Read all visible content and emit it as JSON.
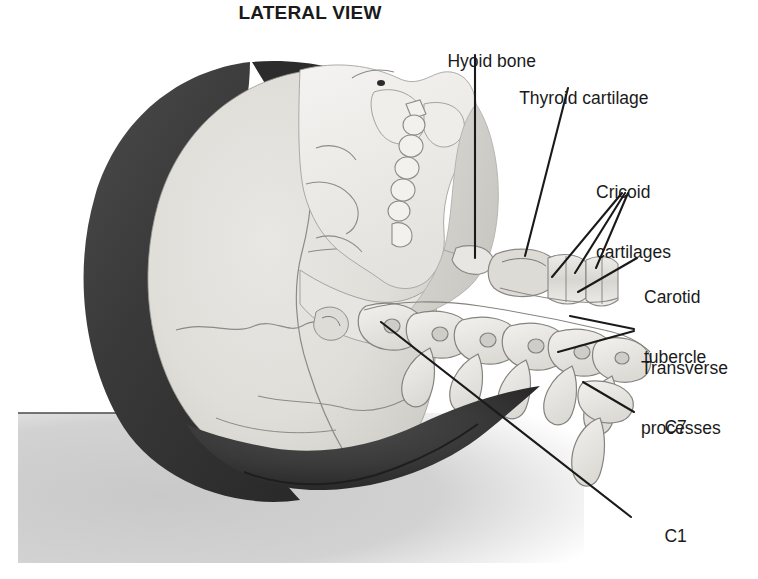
{
  "figure": {
    "title": "LATERAL VIEW",
    "background_color": "#ffffff",
    "ink_color": "#1a1a1a",
    "bone_fill": "#eceae6",
    "soft_tissue_fill": "#d9d7d2",
    "hair_fill": "#3a3a3a",
    "table_surface_fill": "#cfcfcf"
  },
  "labels": [
    {
      "id": "hyoid-bone",
      "text": "Hyoid bone",
      "text2": "",
      "x": 428,
      "y": 31,
      "leader": "vertical"
    },
    {
      "id": "thyroid-cartilage",
      "text": "Thyroid cartilage",
      "text2": "",
      "x": 500,
      "y": 68,
      "leader": "diagonal"
    },
    {
      "id": "cricoid-cartilages",
      "text": "Cricoid",
      "text2": "cartilages",
      "x": 596,
      "y": 141,
      "leader": "three-lines"
    },
    {
      "id": "carotid-tubercle",
      "text": "Carotid",
      "text2": "tubercle",
      "x": 644,
      "y": 246,
      "leader": "diagonal"
    },
    {
      "id": "transverse-processes",
      "text": "Transverse",
      "text2": "processes",
      "x": 641,
      "y": 317,
      "leader": "two-lines"
    },
    {
      "id": "c7",
      "text": "C7",
      "text2": "",
      "x": 645,
      "y": 397,
      "leader": "diagonal"
    },
    {
      "id": "c1",
      "text": "C1",
      "text2": "",
      "x": 645,
      "y": 506,
      "leader": "long-diagonal"
    }
  ],
  "vertebrae": {
    "count": 7,
    "top_label": "C1",
    "bottom_label": "C7"
  },
  "leader_lines": [
    {
      "name": "hyoid-leader",
      "points": "475,55 475,258"
    },
    {
      "name": "thyroid-leader",
      "points": "568,88 525,255"
    },
    {
      "name": "cricoid-leader-1",
      "points": "622,193 553,275"
    },
    {
      "name": "cricoid-leader-2",
      "points": "625,193 575,272"
    },
    {
      "name": "cricoid-leader-3",
      "points": "628,193 594,268"
    },
    {
      "name": "carotid-leader",
      "points": "636,258 578,292"
    },
    {
      "name": "transverse-leader-1",
      "points": "634,329 572,316"
    },
    {
      "name": "transverse-leader-2",
      "points": "634,331 560,350"
    },
    {
      "name": "c7-leader",
      "points": "634,412 583,382"
    },
    {
      "name": "c1-leader",
      "points": "630,517 381,322"
    }
  ]
}
